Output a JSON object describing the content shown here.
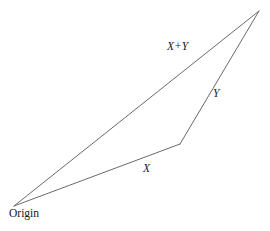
{
  "figure": {
    "background_color": "#ffffff",
    "stroke_color": "#59595e",
    "stroke_width": 0.9,
    "width": 270,
    "height": 231,
    "labels": {
      "origin": "Origin",
      "sum_vector": "X+Y",
      "vector_y": "Y",
      "vector_x": "X"
    },
    "points": {
      "origin": {
        "x": 14,
        "y": 206
      },
      "midpoint": {
        "x": 180,
        "y": 144
      },
      "apex": {
        "x": 259,
        "y": 11
      }
    },
    "segments": [
      {
        "name": "X",
        "from": "origin",
        "to": "midpoint",
        "label": "X"
      },
      {
        "name": "Y",
        "from": "midpoint",
        "to": "apex",
        "label": "Y"
      },
      {
        "name": "X+Y",
        "from": "origin",
        "to": "apex",
        "label": "X+Y"
      }
    ]
  },
  "chart_data": {
    "type": "diagram",
    "xlabel": "",
    "ylabel": "",
    "vertices": [
      {
        "name": "Origin",
        "x": 14,
        "y": 206
      },
      {
        "name": "X head",
        "x": 180,
        "y": 144
      },
      {
        "name": "X+Y head",
        "x": 259,
        "y": 11
      }
    ],
    "edges": [
      {
        "label": "X",
        "start": [
          14,
          206
        ],
        "end": [
          180,
          144
        ]
      },
      {
        "label": "Y",
        "start": [
          180,
          144
        ],
        "end": [
          259,
          11
        ]
      },
      {
        "label": "X+Y",
        "start": [
          14,
          206
        ],
        "end": [
          259,
          11
        ]
      }
    ],
    "annotations": [
      "Origin",
      "X",
      "Y",
      "X+Y"
    ],
    "grid": false,
    "legend": "none"
  }
}
